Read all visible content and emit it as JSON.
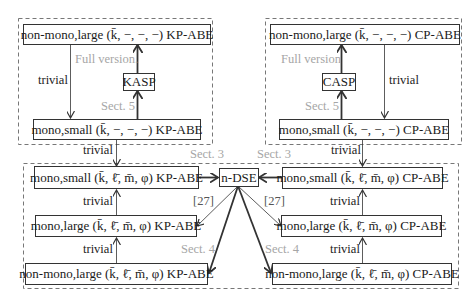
{
  "diagram": {
    "containers": [
      {
        "id": "kp-top-group",
        "style": "dashed"
      },
      {
        "id": "cp-top-group",
        "style": "dashed"
      },
      {
        "id": "bottom-group",
        "style": "dashed"
      }
    ],
    "nodes": {
      "kp_nonmono_large_top": "non-mono,large (k̄, −, −, −) KP-ABE",
      "kp_mono_small_top": "mono,small (k̄, −, −, −) KP-ABE",
      "kasp": "KASP",
      "cp_nonmono_large_top": "non-mono,large (k̄, −, −, −) CP-ABE",
      "cp_mono_small_top": "mono,small (k̄, −, −, −) CP-ABE",
      "casp": "CASP",
      "kp_mono_small": "mono,small (k̄, ℓ̄, m̄, φ) KP-ABE",
      "kp_mono_large": "mono,large (k̄, ℓ̄, m̄, φ) KP-ABE",
      "kp_nonmono_large": "non-mono,large (k̄, ℓ̄, m̄, φ) KP-ABE",
      "ndse": "n-DSE",
      "cp_mono_small": "mono,small (k̄, ℓ̄, m̄, φ) CP-ABE",
      "cp_mono_large": "mono,large (k̄, ℓ̄, m̄, φ) CP-ABE",
      "cp_nonmono_large": "non-mono,large (k̄, ℓ̄, m̄, φ) CP-ABE"
    },
    "edge_labels": {
      "kp_top_trivial": "trivial",
      "kp_full_version": "Full version.",
      "kp_sect5": "Sect. 5",
      "cp_top_trivial": "trivial",
      "cp_full_version": "Full version",
      "cp_sect5": "Sect. 5",
      "kp_link_trivial": "trivial",
      "cp_link_trivial": "trivial",
      "kp_sect3": "Sect. 3",
      "cp_sect3": "Sect. 3",
      "kp_ref27": "[27]",
      "cp_ref27": "[27]",
      "kp_sect4": "Sect. 4",
      "cp_sect4": "Sect. 4",
      "kp_trivial_1": "trivial",
      "kp_trivial_2": "trivial",
      "cp_trivial_1": "trivial",
      "cp_trivial_2": "trivial"
    },
    "colors": {
      "line": "#333333",
      "label_gray": "#a6a6a6",
      "dashed": "#777777"
    }
  }
}
